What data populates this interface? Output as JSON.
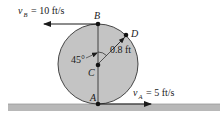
{
  "diagram": {
    "type": "rolling-disk-kinematics",
    "points": {
      "A": {
        "label": "A"
      },
      "B": {
        "label": "B"
      },
      "C": {
        "label": "C"
      },
      "D": {
        "label": "D"
      }
    },
    "velocity_B": {
      "symbol": "v",
      "subscript": "B",
      "text": "= 10 ft/s"
    },
    "velocity_A": {
      "symbol": "v",
      "subscript": "A",
      "text": "= 5 ft/s"
    },
    "radius_label": "0.8 ft",
    "angle_label": "45°",
    "colors": {
      "disk_fill": "#c4c4c4",
      "ground_fill": "#b8b8b8",
      "ink": "#1a1a1a"
    }
  }
}
